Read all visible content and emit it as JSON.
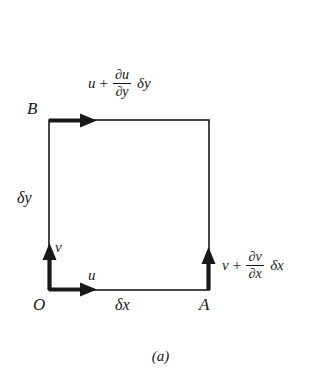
{
  "figure": {
    "caption": "(a)",
    "line_color": "#191919",
    "background": "#ffffff",
    "vertices": {
      "origin": "O",
      "right": "A",
      "top_left": "B"
    },
    "dimensions": {
      "width_label": "δx",
      "height_label": "δy"
    },
    "velocities": {
      "bottom_u": "u",
      "left_v": "v",
      "top": {
        "base": "u",
        "operator": "+",
        "numerator": "∂u",
        "denominator": "∂y",
        "tail": "δy"
      },
      "right": {
        "base": "v",
        "operator": "+",
        "numerator": "∂v",
        "denominator": "∂x",
        "tail": "δx"
      }
    },
    "geometry": {
      "rect_left": 49,
      "rect_top": 120,
      "rect_right": 209,
      "rect_bottom": 290,
      "arrow_length": 47,
      "rect_stroke": 1.6,
      "arrow_stroke": 4
    }
  }
}
